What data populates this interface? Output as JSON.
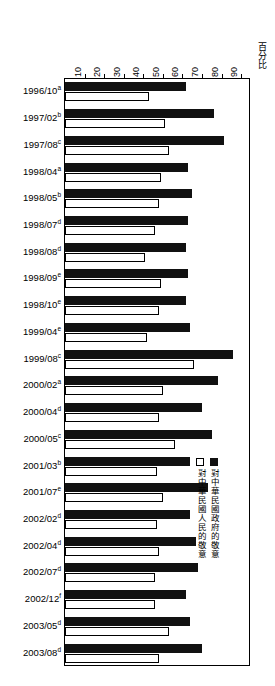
{
  "chart_data": {
    "type": "bar",
    "orientation": "horizontal",
    "title": "",
    "xlabel": "百分比",
    "ylabel": "",
    "xlim": [
      0,
      95
    ],
    "grid": false,
    "legend_position": "inside-right",
    "axis_title": "百分比",
    "ticks": [
      10,
      20,
      30,
      40,
      50,
      60,
      70,
      80,
      90
    ],
    "categories": [
      "1996/10",
      "1997/02",
      "1997/08",
      "1998/04",
      "1998/05",
      "1998/07",
      "1998/08",
      "1998/09",
      "1998/10",
      "1999/04",
      "1999/08",
      "2000/02",
      "2000/04",
      "2000/05",
      "2001/03",
      "2001/07",
      "2002/02",
      "2002/04",
      "2002/07",
      "2002/12",
      "2003/05",
      "2003/08"
    ],
    "category_footnotes": [
      "a",
      "b",
      "c",
      "a",
      "b",
      "d",
      "d",
      "e",
      "e",
      "e",
      "c",
      "a",
      "d",
      "c",
      "b",
      "e",
      "d",
      "d",
      "d",
      "f",
      "d",
      "d"
    ],
    "series": [
      {
        "name": "對中華民國政府的敬意",
        "key": "gov",
        "color": "#111111",
        "values": [
          62,
          76,
          81,
          63,
          65,
          63,
          62,
          63,
          62,
          64,
          86,
          78,
          70,
          75,
          64,
          73,
          64,
          67,
          68,
          62,
          64,
          70
        ]
      },
      {
        "name": "對中華民國人民的敬意",
        "key": "people",
        "color": "#ffffff",
        "values": [
          43,
          51,
          53,
          49,
          48,
          46,
          41,
          49,
          48,
          42,
          66,
          50,
          48,
          56,
          47,
          50,
          47,
          48,
          46,
          46,
          53,
          48
        ]
      }
    ]
  },
  "legend": {
    "items": [
      {
        "label": "對中華民國政府的敬意",
        "swatch": "filled"
      },
      {
        "label": "對中華民國人民的敬意",
        "swatch": "hollow"
      }
    ]
  }
}
